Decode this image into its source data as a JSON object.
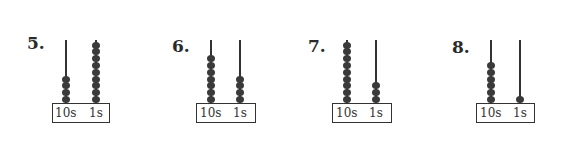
{
  "problems": [
    {
      "number": "5.",
      "tens_label": "10s",
      "ones_label": "1s",
      "tens_beads": 4,
      "ones_beads": 9
    },
    {
      "number": "6.",
      "tens_label": "10s",
      "ones_label": "1s",
      "tens_beads": 7,
      "ones_beads": 4
    },
    {
      "number": "7.",
      "tens_label": "10s",
      "ones_label": "1s",
      "tens_beads": 9,
      "ones_beads": 3
    },
    {
      "number": "8.",
      "tens_label": "10s",
      "ones_label": "1s",
      "tens_beads": 6,
      "ones_beads": 1
    }
  ]
}
